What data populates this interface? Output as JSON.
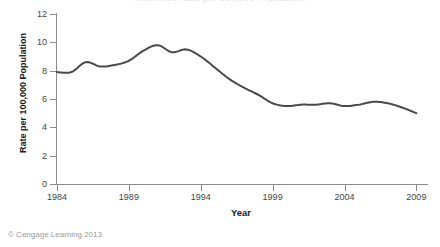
{
  "figure": {
    "credit": "© Cengage Learning 2013",
    "background": "#ffffff"
  },
  "chart_data": {
    "type": "line",
    "title": "Homicide Rate per 100,000 Population",
    "xlabel": "Year",
    "ylabel": "Rate per 100,000 Population",
    "xlim": [
      1984,
      2009.6
    ],
    "ylim": [
      0,
      12
    ],
    "grid": false,
    "legend": null,
    "line_color": "#4a4a4a",
    "line_width": 2,
    "axis_color": "#8c8c8c",
    "x_tick_labels": [
      "1984",
      "1989",
      "1994",
      "1999",
      "2004",
      "2009"
    ],
    "x_ticks": [
      1984,
      1989,
      1994,
      1999,
      2004,
      2009
    ],
    "y_tick_labels": [
      "0",
      "2",
      "4",
      "6",
      "8",
      "10",
      "12"
    ],
    "y_ticks": [
      0,
      2,
      4,
      6,
      8,
      10,
      12
    ],
    "x": [
      1984,
      1985,
      1986,
      1987,
      1988,
      1989,
      1990,
      1991,
      1992,
      1993,
      1994,
      1995,
      1996,
      1997,
      1998,
      1999,
      2000,
      2001,
      2002,
      2003,
      2004,
      2005,
      2006,
      2007,
      2008,
      2009
    ],
    "series": [
      {
        "name": "Rate per 100,000 Population",
        "values": [
          7.9,
          7.9,
          8.6,
          8.3,
          8.4,
          8.7,
          9.4,
          9.8,
          9.3,
          9.5,
          9.0,
          8.2,
          7.4,
          6.8,
          6.3,
          5.7,
          5.5,
          5.6,
          5.6,
          5.7,
          5.5,
          5.6,
          5.8,
          5.7,
          5.4,
          5.0
        ]
      }
    ]
  }
}
